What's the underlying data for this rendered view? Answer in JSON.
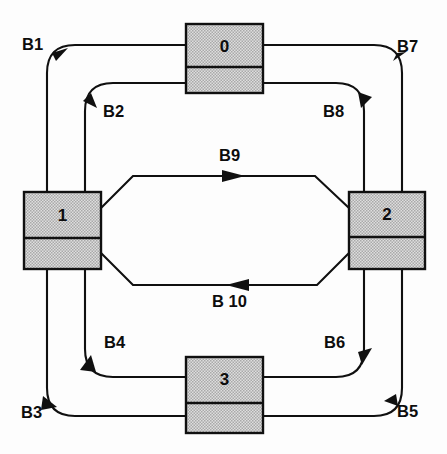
{
  "diagram": {
    "style": {
      "line_color": "#101010",
      "node_fill": "#c9c9c9",
      "background": "#ffffff",
      "text_color": "#0d0d0d"
    },
    "nodes": [
      {
        "id": "node-0",
        "label": "0",
        "x": 186,
        "y": 24,
        "w": 77,
        "h": 69,
        "divider_y": 67
      },
      {
        "id": "node-1",
        "label": "1",
        "x": 24,
        "y": 192,
        "w": 77,
        "h": 77,
        "divider_y": 238
      },
      {
        "id": "node-2",
        "label": "2",
        "x": 349,
        "y": 192,
        "w": 76,
        "h": 77,
        "divider_y": 237
      },
      {
        "id": "node-3",
        "label": "3",
        "x": 186,
        "y": 357,
        "w": 77,
        "h": 76,
        "divider_y": 403
      }
    ],
    "edges": [
      {
        "id": "bus-b1",
        "label": "B1",
        "from": "0",
        "to": "1",
        "corner": "top-left",
        "ring": "outer"
      },
      {
        "id": "bus-b2",
        "label": "B2",
        "from": "1",
        "to": "0",
        "corner": "top-left",
        "ring": "inner"
      },
      {
        "id": "bus-b3",
        "label": "B3",
        "from": "1",
        "to": "3",
        "corner": "bottom-left",
        "ring": "outer"
      },
      {
        "id": "bus-b4",
        "label": "B4",
        "from": "3",
        "to": "1",
        "corner": "bottom-left",
        "ring": "inner"
      },
      {
        "id": "bus-b5",
        "label": "B5",
        "from": "3",
        "to": "2",
        "corner": "bottom-right",
        "ring": "outer"
      },
      {
        "id": "bus-b6",
        "label": "B6",
        "from": "2",
        "to": "3",
        "corner": "bottom-right",
        "ring": "inner"
      },
      {
        "id": "bus-b7",
        "label": "B7",
        "from": "0",
        "to": "2",
        "corner": "top-right",
        "ring": "outer"
      },
      {
        "id": "bus-b8",
        "label": "B8",
        "from": "0",
        "to": "2",
        "corner": "top-right",
        "ring": "inner"
      },
      {
        "id": "bus-b9",
        "label": "B9",
        "from": "1",
        "to": "2",
        "corner": "center",
        "ring": "diagonal"
      },
      {
        "id": "bus-b10",
        "label": "B 10",
        "from": "2",
        "to": "1",
        "corner": "center",
        "ring": "diagonal"
      }
    ],
    "edge_labels": {
      "b1": {
        "text": "B1",
        "x": 22,
        "y": 36
      },
      "b7": {
        "text": "B7",
        "x": 397,
        "y": 38
      },
      "b2": {
        "text": "B2",
        "x": 103,
        "y": 103
      },
      "b8": {
        "text": "B8",
        "x": 323,
        "y": 103
      },
      "b9": {
        "text": "B9",
        "x": 219,
        "y": 147
      },
      "b10": {
        "text": "B 10",
        "x": 212,
        "y": 293
      },
      "b4": {
        "text": "B4",
        "x": 104,
        "y": 334
      },
      "b6": {
        "text": "B6",
        "x": 324,
        "y": 334
      },
      "b3": {
        "text": "B3",
        "x": 21,
        "y": 404
      },
      "b5": {
        "text": "B5",
        "x": 397,
        "y": 403
      }
    }
  }
}
